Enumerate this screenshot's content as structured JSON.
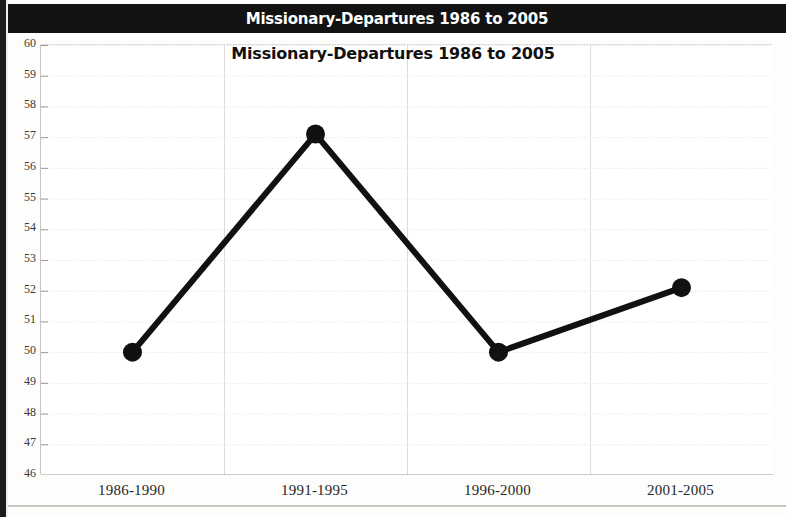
{
  "banner": {
    "title": "Missionary-Departures 1986 to 2005"
  },
  "chart_data": {
    "type": "line",
    "title": "Missionary-Departures 1986 to 2005",
    "xlabel": "",
    "ylabel": "",
    "categories": [
      "1986-1990",
      "1991-1995",
      "1996-2000",
      "2001-2005"
    ],
    "values": [
      50.0,
      57.1,
      50.0,
      52.1
    ],
    "series": [
      {
        "name": "Missionary-Departures",
        "values": [
          50.0,
          57.1,
          50.0,
          52.1
        ]
      }
    ],
    "ylim": [
      46,
      60
    ],
    "ytick_labels": [
      "60",
      "59",
      "58",
      "57",
      "56",
      "55",
      "54",
      "53",
      "52",
      "51",
      "50",
      "49",
      "48",
      "47",
      "46"
    ],
    "ytick_values": [
      60,
      59,
      58,
      57,
      56,
      55,
      54,
      53,
      52,
      51,
      50,
      49,
      48,
      47,
      46
    ],
    "grid": true,
    "legend": "none",
    "line_color": "#111111",
    "marker_color": "#111111",
    "grid_color": "#dedcd9",
    "axis_color": "#3d3d3d"
  }
}
